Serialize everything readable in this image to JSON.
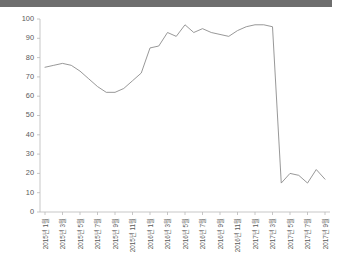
{
  "window": {
    "top_bar_color": "#6e6e6e"
  },
  "chart_data": {
    "type": "line",
    "title": "",
    "subtitle": "",
    "xlabel": "",
    "ylabel": "",
    "grid": false,
    "legend": "none",
    "line_color": "#8c8c8c",
    "axis_color": "#b9b9b9",
    "ylim": [
      0,
      100
    ],
    "yticks": [
      0,
      10,
      20,
      30,
      40,
      50,
      60,
      70,
      80,
      90,
      100
    ],
    "ytick_labels": [
      "0",
      "10",
      "20",
      "30",
      "40",
      "50",
      "60",
      "70",
      "80",
      "90",
      "100"
    ],
    "categories": [
      "2015년 1월",
      "2015년 2월",
      "2015년 3월",
      "2015년 4월",
      "2015년 5월",
      "2015년 6월",
      "2015년 7월",
      "2015년 8월",
      "2015년 9월",
      "2015년 10월",
      "2015년 11월",
      "2015년 12월",
      "2016년 1월",
      "2016년 2월",
      "2016년 3월",
      "2016년 4월",
      "2016년 5월",
      "2016년 6월",
      "2016년 7월",
      "2016년 8월",
      "2016년 9월",
      "2016년 10월",
      "2016년 11월",
      "2016년 12월",
      "2017년 1월",
      "2017년 2월",
      "2017년 3월",
      "2017년 4월",
      "2017년 5월",
      "2017년 6월",
      "2017년 7월",
      "2017년 8월",
      "2017년 9월"
    ],
    "xtick_labels": [
      "2015년 1월",
      "2015년 3월",
      "2015년 5월",
      "2015년 7월",
      "2015년 9월",
      "2015년 11월",
      "2016년 1월",
      "2016년 3월",
      "2016년 5월",
      "2016년 7월",
      "2016년 9월",
      "2016년 11월",
      "2017년 1월",
      "2017년 3월",
      "2017년 5월",
      "2017년 7월",
      "2017년 9월"
    ],
    "xtick_indices": [
      0,
      2,
      4,
      6,
      8,
      10,
      12,
      14,
      16,
      18,
      20,
      22,
      24,
      26,
      28,
      30,
      32
    ],
    "values": [
      75,
      76,
      77,
      76,
      73,
      69,
      65,
      62,
      62,
      64,
      68,
      72,
      85,
      86,
      93,
      91,
      97,
      93,
      95,
      93,
      92,
      91,
      94,
      96,
      97,
      97,
      96,
      15,
      20,
      19,
      15,
      22,
      17
    ]
  }
}
